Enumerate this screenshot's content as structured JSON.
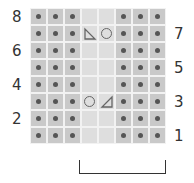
{
  "chart": {
    "title": "",
    "columns": 8,
    "rows": 8,
    "row_numbers_left": [
      "8",
      "6",
      "4",
      "2"
    ],
    "row_numbers_right": [
      "7",
      "5",
      "3",
      "1"
    ],
    "colors": {
      "purl_bg": "#c9c9c9",
      "knit_bg": "#dedede",
      "grid_line": "#f2f2f2",
      "symbol": "#555555"
    },
    "grid": [
      [
        "purl",
        "purl",
        "purl",
        "knit",
        "knit",
        "purl",
        "purl",
        "purl"
      ],
      [
        "purl",
        "purl",
        "purl",
        "ssk",
        "yo",
        "purl",
        "purl",
        "purl"
      ],
      [
        "purl",
        "purl",
        "purl",
        "knit",
        "knit",
        "purl",
        "purl",
        "purl"
      ],
      [
        "purl",
        "purl",
        "purl",
        "knit",
        "knit",
        "purl",
        "purl",
        "purl"
      ],
      [
        "purl",
        "purl",
        "purl",
        "knit",
        "knit",
        "purl",
        "purl",
        "purl"
      ],
      [
        "purl",
        "purl",
        "purl",
        "yo",
        "k2tog",
        "purl",
        "purl",
        "purl"
      ],
      [
        "purl",
        "purl",
        "purl",
        "knit",
        "knit",
        "purl",
        "purl",
        "purl"
      ],
      [
        "purl",
        "purl",
        "purl",
        "knit",
        "knit",
        "purl",
        "purl",
        "purl"
      ]
    ],
    "repeat_bracket": {
      "from_col": 3,
      "to_col": 8
    }
  }
}
